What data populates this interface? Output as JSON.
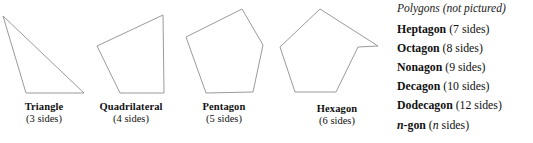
{
  "figure": {
    "kind": "polygon-reference-figure",
    "line_color": "#8e8e8e",
    "text_color": "#111111",
    "background": "#ffffff"
  },
  "pictured": [
    {
      "id": "triangle",
      "name": "Triangle",
      "sides": "(3 sides)",
      "side_count": 3,
      "points": "3,16 26,93 84,93",
      "label_center_x": 44,
      "label_top": 101
    },
    {
      "id": "quadrilateral",
      "name": "Quadrilateral",
      "sides": "(4 sides)",
      "side_count": 4,
      "points": "97,46 163,15 164,93 120,93",
      "label_center_x": 131,
      "label_top": 101
    },
    {
      "id": "pentagon",
      "name": "Pentagon",
      "sides": "(5 sides)",
      "side_count": 5,
      "points": "242,9 263,45 253,92 206,93 186,37",
      "label_center_x": 224,
      "label_top": 101
    },
    {
      "id": "hexagon",
      "name": "Hexagon",
      "sides": "(6 sides)",
      "side_count": 6,
      "points": "320,9 378,46 358,47 336,92 295,92 280,47",
      "label_center_x": 337,
      "label_top": 103
    }
  ],
  "not_pictured": {
    "heading": "Polygons (not pictured)",
    "rows": [
      {
        "name": "Heptagon",
        "sides": "(7 sides)",
        "side_count": 7,
        "italic_name": false,
        "var_sides": false,
        "top": 22
      },
      {
        "name": "Octagon",
        "sides": "(8 sides)",
        "side_count": 8,
        "italic_name": false,
        "var_sides": false,
        "top": 41
      },
      {
        "name": "Nonagon",
        "sides": "(9 sides)",
        "side_count": 9,
        "italic_name": false,
        "var_sides": false,
        "top": 60
      },
      {
        "name": "Decagon",
        "sides": "(10 sides)",
        "side_count": 10,
        "italic_name": false,
        "var_sides": false,
        "top": 79
      },
      {
        "name": "Dodecagon",
        "sides": "(12 sides)",
        "side_count": 12,
        "italic_name": false,
        "var_sides": false,
        "top": 98
      },
      {
        "name": "n-gon",
        "sides": "(n sides)",
        "side_count": "n",
        "italic_name": true,
        "var_sides": true,
        "top": 118
      }
    ]
  }
}
